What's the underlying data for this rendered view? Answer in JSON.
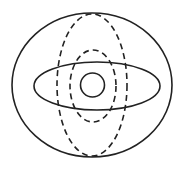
{
  "diagram": {
    "stroke_color": "#222222",
    "background": "#ffffff",
    "shapes": [
      {
        "name": "outer-ellipse",
        "style": "solid"
      },
      {
        "name": "tall-dashed-ellipse",
        "style": "dashed"
      },
      {
        "name": "inner-dashed-ellipse",
        "style": "dashed"
      },
      {
        "name": "horizontal-ellipse",
        "style": "solid"
      },
      {
        "name": "center-circle",
        "style": "solid"
      }
    ]
  }
}
